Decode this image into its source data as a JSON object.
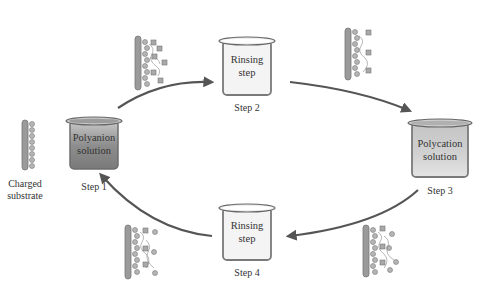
{
  "diagram": {
    "substrate_label_line1": "Charged",
    "substrate_label_line2": "substrate",
    "steps": [
      {
        "id": 1,
        "caption": "Step 1",
        "beaker_line1": "Polyanion",
        "beaker_line2": "solution",
        "fill": "dark-gradient"
      },
      {
        "id": 2,
        "caption": "Step 2",
        "beaker_line1": "Rinsing",
        "beaker_line2": "step",
        "fill": "light"
      },
      {
        "id": 3,
        "caption": "Step 3",
        "beaker_line1": "Polycation",
        "beaker_line2": "solution",
        "fill": "mid-gradient"
      },
      {
        "id": 4,
        "caption": "Step 4",
        "beaker_line1": "Rinsing",
        "beaker_line2": "step",
        "fill": "light"
      }
    ],
    "arrows": [
      {
        "from": 1,
        "to": 2
      },
      {
        "from": 2,
        "to": 3
      },
      {
        "from": 3,
        "to": 4
      },
      {
        "from": 4,
        "to": 1
      }
    ],
    "colors": {
      "arrow": "#555555",
      "beaker_rim": "#8a8a8a",
      "beaker_dark": "#8c8c8c",
      "beaker_light": "#f2f2f2",
      "substrate": "#9a9a9a",
      "bead": "#a8a8a8"
    }
  }
}
